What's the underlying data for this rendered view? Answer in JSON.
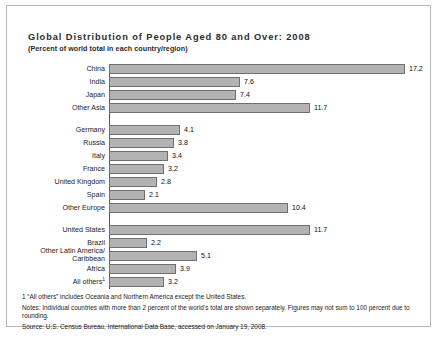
{
  "chart_data": {
    "type": "bar",
    "orientation": "horizontal",
    "title": "Global Distribution of People Aged 80 and Over: 2008",
    "subtitle": "(Percent of world total in each country/region)",
    "xlabel": "",
    "ylabel": "",
    "xlim": [
      0,
      17.2
    ],
    "grid": false,
    "legend": "none",
    "value_labels": true,
    "categories": [
      "China",
      "India",
      "Japan",
      "Other Asia",
      "Germany",
      "Russia",
      "Italy",
      "France",
      "United Kingdom",
      "Spain",
      "Other Europe",
      "United States",
      "Brazil",
      "Other Latin America/ Caribbean",
      "Africa",
      "All others"
    ],
    "values": [
      17.2,
      7.6,
      7.4,
      11.7,
      4.1,
      3.8,
      3.4,
      3.2,
      2.8,
      2.1,
      10.4,
      11.7,
      2.2,
      5.1,
      3.9,
      3.2
    ],
    "groups": [
      {
        "name": "Asia",
        "rows": [
          0,
          1,
          2,
          3
        ]
      },
      {
        "name": "Europe",
        "rows": [
          4,
          5,
          6,
          7,
          8,
          9,
          10
        ]
      },
      {
        "name": "Americas and other",
        "rows": [
          11,
          12,
          13,
          14,
          15
        ]
      }
    ],
    "bars": [
      {
        "label": "China",
        "value": 17.2,
        "value_text": "17.2",
        "group": 0,
        "two_line": false
      },
      {
        "label": "India",
        "value": 7.6,
        "value_text": "7.6",
        "group": 0,
        "two_line": false
      },
      {
        "label": "Japan",
        "value": 7.4,
        "value_text": "7.4",
        "group": 0,
        "two_line": false
      },
      {
        "label": "Other Asia",
        "value": 11.7,
        "value_text": "11.7",
        "group": 0,
        "two_line": false
      },
      {
        "label": "Germany",
        "value": 4.1,
        "value_text": "4.1",
        "group": 1,
        "two_line": false
      },
      {
        "label": "Russia",
        "value": 3.8,
        "value_text": "3.8",
        "group": 1,
        "two_line": false
      },
      {
        "label": "Italy",
        "value": 3.4,
        "value_text": "3.4",
        "group": 1,
        "two_line": false
      },
      {
        "label": "France",
        "value": 3.2,
        "value_text": "3.2",
        "group": 1,
        "two_line": false
      },
      {
        "label": "United Kingdom",
        "value": 2.8,
        "value_text": "2.8",
        "group": 1,
        "two_line": false
      },
      {
        "label": "Spain",
        "value": 2.1,
        "value_text": "2.1",
        "group": 1,
        "two_line": false
      },
      {
        "label": "Other Europe",
        "value": 10.4,
        "value_text": "10.4",
        "group": 1,
        "two_line": false
      },
      {
        "label": "United States",
        "value": 11.7,
        "value_text": "11.7",
        "group": 2,
        "two_line": false
      },
      {
        "label": "Brazil",
        "value": 2.2,
        "value_text": "2.2",
        "group": 2,
        "two_line": false
      },
      {
        "label": "Other Latin America/",
        "label2": "Caribbean",
        "value": 5.1,
        "value_text": "5.1",
        "group": 2,
        "two_line": true
      },
      {
        "label": "Africa",
        "value": 3.9,
        "value_text": "3.9",
        "group": 2,
        "two_line": false
      },
      {
        "label": "All others",
        "footnote_marker": "1",
        "value": 3.2,
        "value_text": "3.2",
        "group": 2,
        "two_line": false
      }
    ]
  },
  "footnotes": {
    "marker_note": "1 “All others” includes Oceania and Northern America except the United States.",
    "notes": "Notes: Individual countries with more than 2 percent of the world’s total are shown separately. Figures may not sum to 100 percent due to rounding.",
    "source": "Source:  U.S. Census Bureau, International Data Base, accessed on January 19, 2008."
  },
  "colors": {
    "bar_fill": "#b3b3b3",
    "bar_stroke": "#6f7073",
    "axis": "#55575a",
    "frame": "#b9b9b9",
    "text": "#1c1c1c"
  }
}
